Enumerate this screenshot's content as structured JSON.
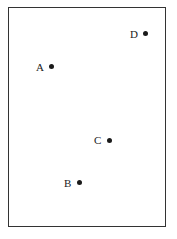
{
  "diagram": {
    "type": "labeled-points",
    "points": [
      {
        "label": "A",
        "x": 51,
        "y": 66
      },
      {
        "label": "B",
        "x": 79,
        "y": 182
      },
      {
        "label": "C",
        "x": 109,
        "y": 140
      },
      {
        "label": "D",
        "x": 145,
        "y": 33
      }
    ],
    "colors": {
      "dot": "#1a1a1a",
      "frame": "#333333",
      "text": "#222222"
    }
  }
}
